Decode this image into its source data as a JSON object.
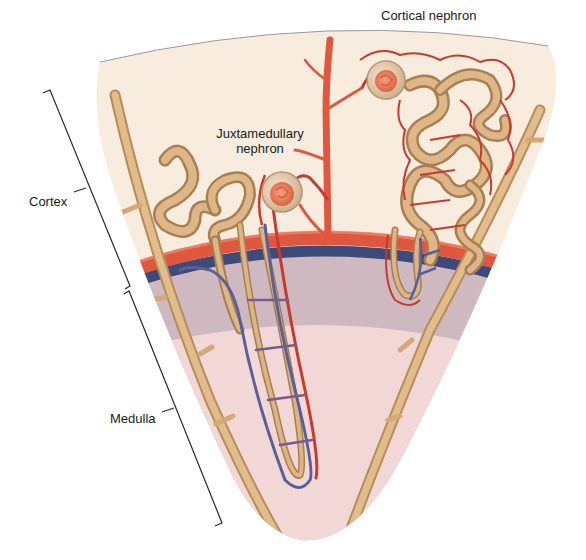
{
  "figure": {
    "colors": {
      "background": "#ffffff",
      "cortex_fill": "#f7ecdd",
      "outer_medulla_fill": "#cdb9bf",
      "inner_medulla_fill": "#f1d7d6",
      "outline": "#8c8c8c",
      "artery": "#e0573f",
      "artery_dark": "#b8352a",
      "vein": "#3d4a7a",
      "tubule": "#d9b07e",
      "tubule_dark": "#a87f52",
      "collecting_duct": "#d4a877",
      "capillary": "#c8392e",
      "glomerulus": "#ec8a66",
      "bowman_capsule": "#ecd7bd",
      "label_text": "#1a1a1a",
      "bracket": "#2a2a2a"
    }
  },
  "labels": {
    "cortical_nephron": "Cortical nephron",
    "juxtamedullary_line1": "Juxtamedullary",
    "juxtamedullary_line2": "nephron",
    "cortex": "Cortex",
    "medulla": "Medulla"
  },
  "regions": [
    {
      "name": "Cortex",
      "extent": "top of wedge to arcuate vessels"
    },
    {
      "name": "Medulla",
      "extent": "arcuate vessels to tip of wedge"
    }
  ],
  "structures": [
    "Cortical nephron",
    "Juxtamedullary nephron",
    "Interlobular artery",
    "Arcuate artery",
    "Arcuate vein",
    "Collecting ducts",
    "Vasa recta",
    "Peritubular capillaries"
  ]
}
